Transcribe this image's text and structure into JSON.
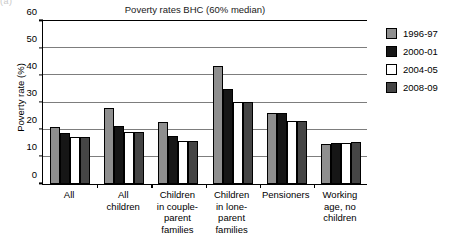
{
  "top_fragment": "(a)",
  "chart_data": {
    "type": "bar",
    "title": "Poverty rates BHC (60% median)",
    "xlabel": "",
    "ylabel": "Poverty rate (%)",
    "ylim": [
      0,
      60
    ],
    "yticks": [
      0,
      10,
      20,
      30,
      40,
      50,
      60
    ],
    "grid": true,
    "legend_position": "right",
    "categories": [
      "All",
      "All children",
      "Children in couple-parent families",
      "Children in lone-parent families",
      "Pensioners",
      "Working age, no children"
    ],
    "category_label_lines": [
      [
        "All"
      ],
      [
        "All",
        "children"
      ],
      [
        "Children",
        "in couple-",
        "parent",
        "families"
      ],
      [
        "Children",
        "in lone-",
        "parent",
        "families"
      ],
      [
        "Pensioners"
      ],
      [
        "Working",
        "age, no",
        "children"
      ]
    ],
    "series": [
      {
        "name": "1996-97",
        "color": "#8f8f8f",
        "values": [
          21.0,
          28.0,
          22.8,
          43.5,
          26.0,
          14.8
        ]
      },
      {
        "name": "2000-01",
        "color": "#161616",
        "values": [
          18.7,
          21.5,
          17.6,
          34.8,
          26.0,
          15.0
        ]
      },
      {
        "name": "2004-05",
        "color": "#ffffff",
        "values": [
          17.2,
          19.0,
          16.0,
          30.2,
          23.2,
          15.0
        ]
      },
      {
        "name": "2008-09",
        "color": "#454545",
        "values": [
          17.4,
          19.0,
          15.7,
          30.1,
          23.2,
          15.3
        ]
      }
    ]
  }
}
